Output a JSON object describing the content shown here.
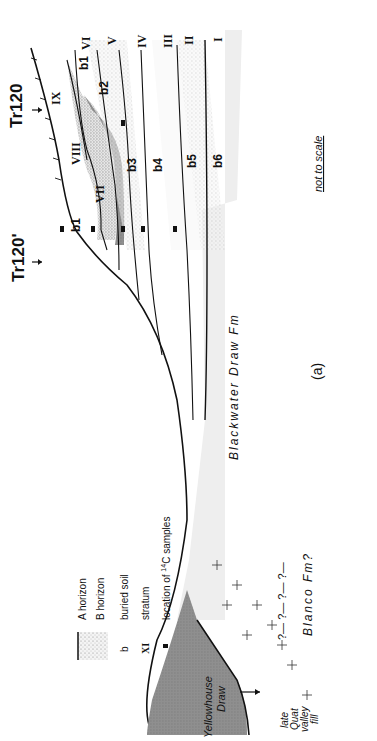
{
  "figure": {
    "panel_label": "(a)",
    "scale_note": "not to scale",
    "orientation": "rotated 90 degrees clockwise"
  },
  "sections": {
    "tr120": "Tr120",
    "tr120_prime": "Tr120'"
  },
  "strata": [
    "I",
    "II",
    "III",
    "IV",
    "V",
    "VI",
    "VII",
    "VIII",
    "IX"
  ],
  "buried_soils": [
    "b1",
    "b1",
    "b2",
    "b2'",
    "b3",
    "b4",
    "b5",
    "b6"
  ],
  "labels": {
    "stratum_I": "I",
    "stratum_II": "II",
    "stratum_III": "III",
    "stratum_IV": "IV",
    "stratum_V": "V",
    "stratum_VI": "VI",
    "stratum_VII": "VII",
    "stratum_VIII": "VIII",
    "stratum_IX": "IX",
    "soil_b1_upper": "b1",
    "soil_b1_lower": "b1",
    "soil_b2": "b2",
    "soil_b3": "b3",
    "soil_b4": "b4",
    "soil_b5": "b5",
    "soil_b6": "b6",
    "formation_blackwater": "Blackwater  Draw  Fm",
    "formation_blanco": "Blanco  Fm?",
    "valley_fill_1": "late",
    "valley_fill_2": "Quat",
    "valley_fill_3": "valley",
    "valley_fill_4": "fill",
    "yellowhouse_1": "Yellowhouse",
    "yellowhouse_2": "Draw",
    "question_marks": "?— ?— ?— ?—"
  },
  "legend": {
    "items": [
      {
        "symbol": "stipple-with-line",
        "label": "A horizon"
      },
      {
        "symbol": "dashes",
        "label": "B horizon"
      },
      {
        "symbol": "b",
        "label": "buried  soil"
      },
      {
        "symbol": "XI",
        "label": "stratum"
      },
      {
        "symbol": "black-square",
        "label": "location of 14C samples"
      }
    ],
    "a_horizon": "A horizon",
    "b_horizon": "B horizon",
    "b_symbol": "b",
    "buried_soil": "buried  soil",
    "stratum_symbol": "XI",
    "stratum": "stratum",
    "c14_prefix": "location  of ",
    "c14_sup": "14",
    "c14_suffix": "C  samples"
  },
  "colors": {
    "line": "#111111",
    "stipple": "#9a9a9a",
    "shade_dark": "#8c8c8c",
    "shade_light": "#cfcfcf",
    "blackwater_band": "#ececec",
    "background": "#ffffff"
  }
}
